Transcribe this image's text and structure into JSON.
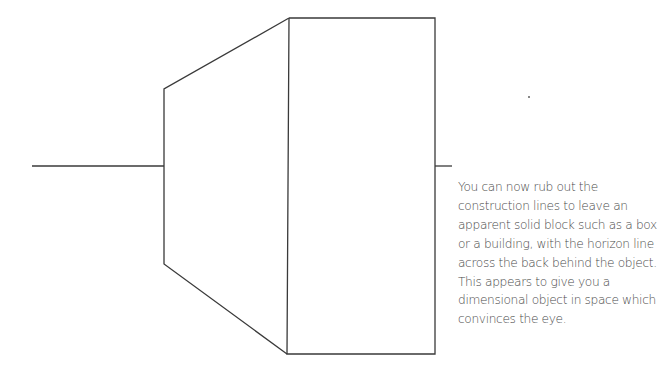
{
  "illustration": {
    "title": "Two-point perspective block with horizon line",
    "horizon_line": {
      "y": 166,
      "left_segment": [
        32,
        164
      ],
      "right_segment": [
        435,
        452
      ]
    },
    "front_face": {
      "x1": 289,
      "y1": 18,
      "x2": 435,
      "y2": 354
    },
    "side_face": {
      "top_left": [
        164,
        89
      ],
      "bottom_left": [
        164,
        264
      ],
      "top_right": [
        289,
        18
      ],
      "bottom_right": [
        287,
        354
      ]
    },
    "line_color": "#3a3a3a"
  },
  "caption": {
    "lines": [
      "You can now rub out the",
      "construction lines to leave an",
      "apparent solid block such as a box",
      "or a building, with the horizon line",
      "across the back behind the object.",
      "This appears to give you a",
      "dimensional object in space which",
      "convinces the eye."
    ]
  }
}
